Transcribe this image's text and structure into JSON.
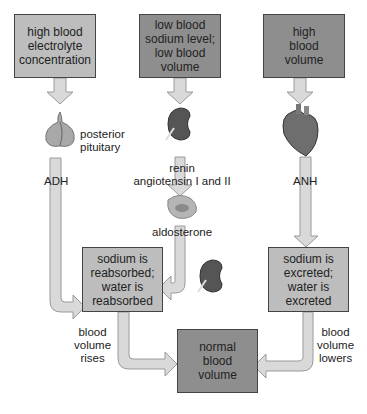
{
  "boxes": {
    "electrolyte": "high blood\nelectrolyte\nconcentration",
    "low_sodium": "low blood\nsodium level;\nlow blood\nvolume",
    "high_volume": "high\nblood\nvolume",
    "reabsorbed": "sodium is\nreabsorbed;\nwater is\nreabsorbed",
    "excreted": "sodium is\nexcreted;\nwater is\nexcreted",
    "normal": "normal\nblood\nvolume"
  },
  "labels": {
    "posterior_pituitary": "posterior\npituitary",
    "adh": "ADH",
    "renin": "renin\nangiotensin I and II",
    "aldosterone": "aldosterone",
    "anh": "ANH",
    "rises": "blood\nvolume\nrises",
    "lowers": "blood\nvolume\nlowers"
  },
  "colors": {
    "box_light": "#bdbdbd",
    "box_dark": "#8e8e8e",
    "arrow_fill": "#d9d9d9",
    "arrow_stroke": "#9a9a9a"
  }
}
